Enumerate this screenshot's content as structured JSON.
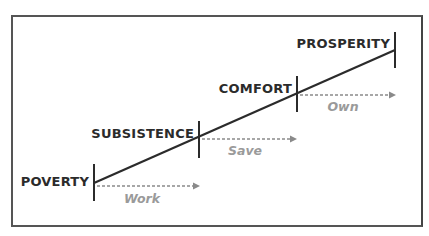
{
  "diagram": {
    "type": "progression-staircase",
    "stages": [
      {
        "label": "POVERTY",
        "x": 94,
        "y": 183
      },
      {
        "label": "SUBSISTENCE",
        "x": 199,
        "y": 138
      },
      {
        "label": "COMFORT",
        "x": 297,
        "y": 93
      },
      {
        "label": "PROSPERITY",
        "x": 395,
        "y": 50
      }
    ],
    "actions": [
      {
        "label": "Work",
        "from": "POVERTY",
        "to": "SUBSISTENCE"
      },
      {
        "label": "Save",
        "from": "SUBSISTENCE",
        "to": "COMFORT"
      },
      {
        "label": "Own",
        "from": "COMFORT",
        "to": "PROSPERITY"
      }
    ],
    "colors": {
      "line": "#2b2b2b",
      "stage_text": "#2b2b2b",
      "action_text": "#9a9a9a",
      "arrow": "#8a8a8a",
      "border": "#555555"
    }
  }
}
